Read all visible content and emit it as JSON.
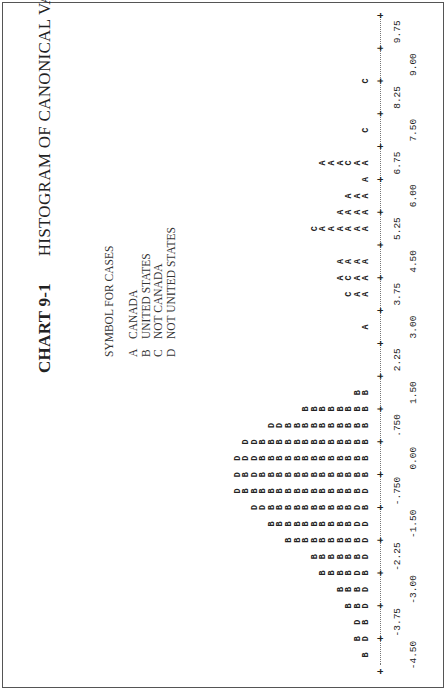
{
  "header": {
    "chart_number": "CHART 9-1",
    "title": "HISTOGRAM OF CANONICAL VARIABLE"
  },
  "legend": {
    "heading": "SYMBOL FOR CASES",
    "items": [
      {
        "symbol": "A",
        "label": "CANADA"
      },
      {
        "symbol": "B",
        "label": "UNITED STATES"
      },
      {
        "symbol": "C",
        "label": "NOT CANADA"
      },
      {
        "symbol": "D",
        "label": "NOT UNITED STATES"
      }
    ]
  },
  "axis": {
    "ticks_upper": [
      "-3.75",
      "-2.25",
      "-.750",
      ".750",
      "2.25",
      "3.75",
      "5.25",
      "6.75",
      "8.25",
      "9.75"
    ],
    "ticks_lower": [
      "-4.50",
      "-3.00",
      "-1.50",
      "0.00",
      "1.50",
      "3.00",
      "4.50",
      "6.00",
      "7.50",
      "9.00"
    ],
    "group_markers": [
      {
        "label": "-2",
        "at": "-0.75"
      },
      {
        "label": "+1",
        "at": "5.25"
      },
      {
        "label": "3",
        "at": "6.0"
      }
    ]
  },
  "chart_data": {
    "type": "bar",
    "title": "HISTOGRAM OF CANONICAL VARIABLE",
    "subtitle": "CHART 9-1",
    "xlabel": "Canonical variable score",
    "ylabel": "Number of cases (stacked symbols)",
    "xlim": [
      -4.875,
      10.125
    ],
    "grid": false,
    "legend_position": "top-left",
    "categories": [
      "-4.50",
      "-4.125",
      "-3.75",
      "-3.375",
      "-3.00",
      "-2.625",
      "-2.25",
      "-1.875",
      "-1.50",
      "-1.125",
      "-0.75",
      "-0.375",
      "0.00",
      "0.375",
      "0.75",
      "1.125",
      "1.50",
      "1.875",
      "2.25",
      "2.625",
      "3.00",
      "3.375",
      "3.75",
      "4.125",
      "4.50",
      "4.875",
      "5.25",
      "5.625",
      "6.00",
      "6.375",
      "6.75",
      "7.125",
      "7.50",
      "7.875",
      "8.25",
      "8.625",
      "9.00",
      "9.375",
      "9.75"
    ],
    "series": [
      {
        "name": "A CANADA",
        "values": [
          0,
          0,
          0,
          0,
          0,
          0,
          0,
          0,
          0,
          0,
          0,
          0,
          0,
          0,
          0,
          0,
          0,
          0,
          0,
          0,
          1,
          0,
          2,
          2,
          3,
          0,
          6,
          4,
          2,
          1,
          3,
          0,
          0,
          0,
          0,
          0,
          0,
          0,
          0
        ]
      },
      {
        "name": "B UNITED STATES",
        "values": [
          1,
          2,
          3,
          4,
          8,
          10,
          14,
          16,
          18,
          20,
          20,
          18,
          16,
          14,
          10,
          6,
          2,
          0,
          0,
          0,
          0,
          0,
          0,
          0,
          0,
          0,
          0,
          0,
          0,
          0,
          0,
          0,
          0,
          0,
          0,
          0,
          0,
          0,
          0
        ]
      },
      {
        "name": "C NOT CANADA",
        "values": [
          0,
          0,
          0,
          0,
          0,
          0,
          0,
          0,
          0,
          0,
          0,
          0,
          0,
          0,
          0,
          0,
          0,
          0,
          0,
          0,
          0,
          0,
          1,
          1,
          1,
          0,
          1,
          0,
          0,
          0,
          1,
          0,
          1,
          0,
          0,
          1,
          0,
          0,
          0
        ]
      },
      {
        "name": "D NOT UNITED STATES",
        "values": [
          0,
          1,
          1,
          1,
          2,
          3,
          4,
          5,
          6,
          6,
          5,
          4,
          3,
          2,
          1,
          0,
          0,
          0,
          0,
          0,
          0,
          0,
          0,
          0,
          0,
          0,
          0,
          0,
          0,
          0,
          0,
          0,
          0,
          0,
          0,
          0,
          0,
          0,
          0
        ]
      }
    ]
  },
  "columns": [
    "B",
    "DB",
    "BD",
    "DBB",
    "DBBB",
    "BDBBBB",
    "DBBBBBB",
    "DBBBBBBBBB",
    "DDBBBBBBBBBB",
    "BDBBBBBBBBBBDD",
    "DBBBBBBBBBBBBBBD",
    "BBBBBBBBBBBBBDBD",
    "BBBBBBBBBBBBBDDD",
    "BBBBBBBBBBBBBDD",
    "BBBBBBBBBBDD",
    "BBBBBBBB",
    "BB",
    "",
    "",
    "",
    "A",
    "",
    "AAC",
    "AACA",
    "AAAA",
    "",
    "AAAAAAC",
    "AAAA",
    "AAA",
    "A",
    "AACAAA",
    "",
    "C",
    "",
    "",
    "C",
    "",
    "",
    ""
  ]
}
